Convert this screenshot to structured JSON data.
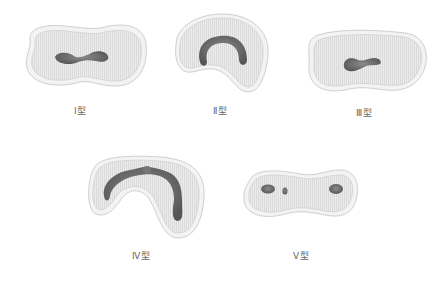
{
  "figure": {
    "colors": {
      "outline": "#cfcfcf",
      "fill": "#e9e9e9",
      "striation": "#d6d6d6",
      "core": "#6a6a6a"
    },
    "types": [
      {
        "id": "I",
        "label": "Ⅰ型"
      },
      {
        "id": "II",
        "label": "Ⅱ型"
      },
      {
        "id": "III",
        "label": "Ⅲ型"
      },
      {
        "id": "IV",
        "label": "Ⅳ型"
      },
      {
        "id": "V",
        "label": "Ⅴ型"
      }
    ]
  }
}
